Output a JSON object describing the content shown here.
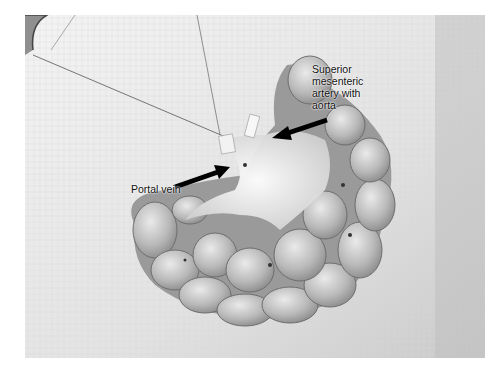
{
  "image": {
    "description": "Grayscale photograph of a dissected small intestine with mesentery laid on surgical gauze",
    "labels": [
      {
        "id": "sma",
        "text": "Superior\nmesenteric\nartery with\naorta"
      },
      {
        "id": "pv",
        "text": "Portal vein"
      }
    ],
    "arrows": [
      {
        "id": "sma-arrow",
        "points_to": "Superior mesenteric artery with aorta"
      },
      {
        "id": "pv-arrow",
        "points_to": "Portal vein"
      }
    ]
  }
}
